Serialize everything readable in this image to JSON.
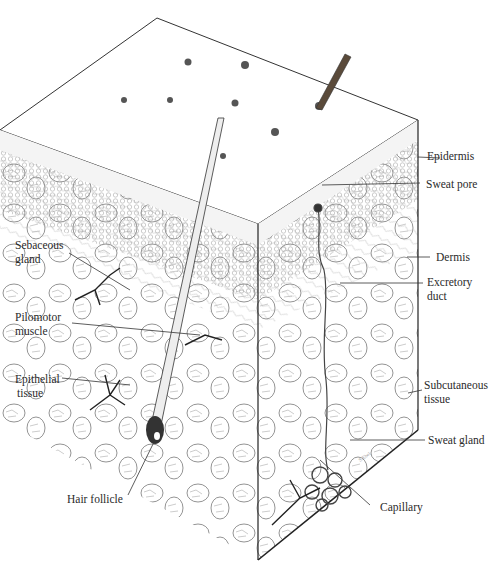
{
  "diagram": {
    "type": "anatomical illustration",
    "colors": {
      "ink": "#2a2a2a",
      "paper": "#ffffff",
      "texture": "#8a8a8a"
    }
  },
  "labels_right": {
    "epidermis": "Epidermis",
    "sweat_pore": "Sweat pore",
    "dermis": "Dermis",
    "excretory_duct_1": "Excretory",
    "excretory_duct_2": "duct",
    "subcutaneous_1": "Subcutaneous",
    "subcutaneous_2": "tissue",
    "sweat_gland": "Sweat gland",
    "capillary": "Capillary"
  },
  "labels_left": {
    "sebaceous_1": "Sebaceous",
    "sebaceous_2": "gland",
    "pilomotor_1": "Pilomotor",
    "pilomotor_2": "muscle",
    "epithelial_1": "Epithelial",
    "epithelial_2": "tissue",
    "hair_follicle": "Hair follicle"
  }
}
